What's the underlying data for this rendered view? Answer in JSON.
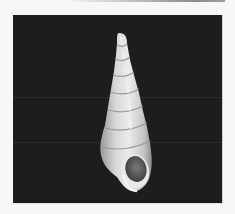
{
  "image": {
    "subject": "turreted-gastropod-shell",
    "orientation": "apex-up-aperture-facing-viewer",
    "colors": {
      "page_background": "#f7f7f7",
      "photo_background": "#1d1d1d",
      "shell_light": "#e6e6e6",
      "shell_mid": "#bdbdbd",
      "shell_shadow": "#8c8c8c",
      "aperture_interior": "#5a5a5a"
    },
    "whorl_count": 8,
    "scanlines_y": [
      82,
      127
    ]
  }
}
